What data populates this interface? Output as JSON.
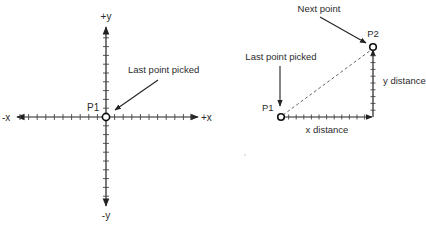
{
  "left_diagram": {
    "axis_labels": {
      "pos_y": "+y",
      "neg_y": "-y",
      "neg_x": "-x",
      "pos_x": "+x"
    },
    "point_label": "P1",
    "callout": "Last point picked",
    "origin": [
      106,
      117
    ],
    "x_ticks": [
      -10,
      -9,
      -8,
      -7,
      -6,
      -5,
      -4,
      -3,
      -2,
      -1,
      1,
      2,
      3,
      4,
      5,
      6,
      7,
      8,
      9,
      10
    ],
    "y_ticks": [
      -9,
      -8,
      -7,
      -6,
      -5,
      -4,
      -3,
      -2,
      -1,
      1,
      2,
      3,
      4,
      5,
      6,
      7,
      8,
      9
    ]
  },
  "right_diagram": {
    "p1_label": "P1",
    "p2_label": "P2",
    "last_point_callout": "Last point picked",
    "next_point_callout": "Next point",
    "x_distance_label": "x distance",
    "y_distance_label": "y distance"
  },
  "colors": {
    "stroke": "#222222",
    "text": "#2b2b2b",
    "background": "#ffffff"
  }
}
